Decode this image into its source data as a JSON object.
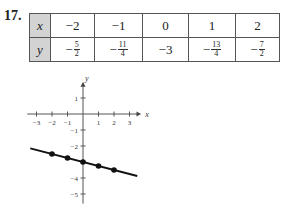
{
  "problem_number": "17.",
  "table": {
    "row_labels": [
      "x",
      "y"
    ],
    "x_values": [
      "−2",
      "−1",
      "0",
      "1",
      "2"
    ],
    "y_values": [
      {
        "sign": "−",
        "num": "5",
        "den": "2"
      },
      {
        "sign": "−",
        "num": "11",
        "den": "4"
      },
      {
        "sign": "",
        "text": "−3"
      },
      {
        "sign": "−",
        "num": "13",
        "den": "4"
      },
      {
        "sign": "−",
        "num": "7",
        "den": "2"
      }
    ]
  },
  "chart_data": {
    "type": "line",
    "title": "",
    "xlabel": "x",
    "ylabel": "y",
    "x": [
      -2,
      -1,
      0,
      1,
      2
    ],
    "series": [
      {
        "name": "y = -x/4 - 3",
        "values": [
          -2.5,
          -2.75,
          -3,
          -3.25,
          -3.5
        ]
      }
    ],
    "xlim": [
      -3.5,
      3.5
    ],
    "ylim": [
      -5.5,
      2
    ],
    "x_ticks": [
      "-3",
      "-2",
      "-1",
      "1",
      "2",
      "3"
    ],
    "y_ticks": [
      "1",
      "-1",
      "-2",
      "-4",
      "-5"
    ],
    "grid": false,
    "legend": "none",
    "line_extent": {
      "x_start": -3.4,
      "x_end": 3.5
    }
  }
}
